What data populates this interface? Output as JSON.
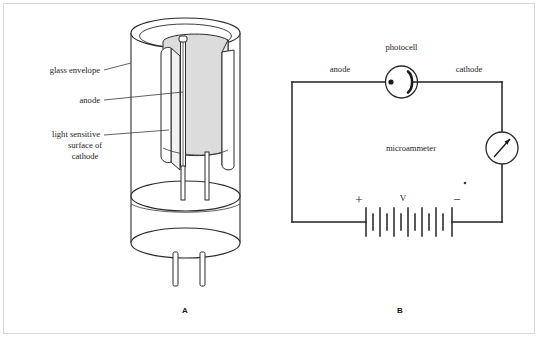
{
  "figure": {
    "title_letters": {
      "left_panel": "A",
      "right_panel": "B"
    },
    "colors": {
      "ink": "#2b2b2b",
      "wire": "#222222",
      "cathode_fill": "#dcdcdc",
      "background": "#ffffff",
      "frame": "#d8d8d8"
    }
  },
  "panel_a": {
    "name": "phototube-construction",
    "letter": "A",
    "labels": {
      "glass_envelope": "glass envelope",
      "anode": "anode",
      "cathode_line1": "light sensitive",
      "cathode_line2": "surface of",
      "cathode_line3": "cathode"
    }
  },
  "panel_b": {
    "name": "photocell-circuit",
    "letter": "B",
    "labels": {
      "photocell": "photocell",
      "anode": "anode",
      "cathode": "cathode",
      "microammeter": "microammeter",
      "battery_voltage": "V",
      "battery_positive": "+",
      "battery_negative": "−"
    },
    "battery": {
      "cell_count": 6,
      "plate_pattern": "long-short alternating"
    }
  }
}
